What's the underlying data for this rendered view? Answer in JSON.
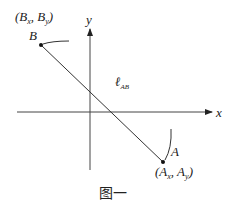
{
  "diagram": {
    "axes": {
      "x_label": "x",
      "y_label": "y"
    },
    "points": {
      "B": {
        "label": "B",
        "coords_label_main": "(B",
        "coords_label_x_sub": "x",
        "coords_label_sep": ", B",
        "coords_label_y_sub": "y",
        "coords_label_end": ")"
      },
      "A": {
        "label": "A",
        "coords_label_main": "(A",
        "coords_label_x_sub": "x",
        "coords_label_sep": ", A",
        "coords_label_y_sub": "y",
        "coords_label_end": ")"
      }
    },
    "segment_label": {
      "main": "ℓ",
      "sub": "AB"
    },
    "caption": "图一",
    "colors": {
      "line": "#333333",
      "text": "#222222",
      "background": "#ffffff"
    }
  }
}
